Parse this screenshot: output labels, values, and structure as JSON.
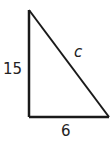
{
  "diagram": {
    "type": "right-triangle",
    "labels": {
      "vertical_leg": "15",
      "horizontal_leg": "6",
      "hypotenuse": "c"
    },
    "colors": {
      "stroke": "#1a1a1a",
      "background": "#ffffff"
    }
  }
}
